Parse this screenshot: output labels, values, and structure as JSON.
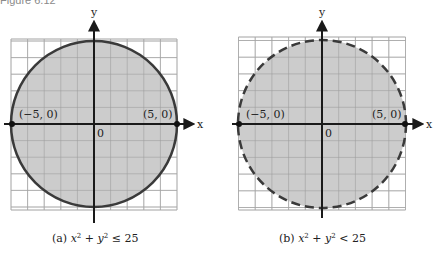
{
  "figure": {
    "title": "Figure 6.12"
  },
  "colors": {
    "fill": "#c8c8c8",
    "grid": "#b9b9b9",
    "stroke": "#3a3a3a",
    "axis": "#1a1a1a"
  },
  "panels": [
    {
      "id": "a",
      "caption_prefix": "(a) ",
      "caption_lhs_x": "x",
      "caption_lhs_exp": "2",
      "caption_plus": " + ",
      "caption_lhs_y": "y",
      "caption_lhs_exp2": "2",
      "caption_rel": " ≤ 25",
      "boundary": "solid",
      "points": [
        {
          "label": "(−5, 0)",
          "x": -5,
          "y": 0
        },
        {
          "label": "(5, 0)",
          "x": 5,
          "y": 0
        }
      ],
      "origin_label": "0",
      "x_axis_label": "x",
      "y_axis_label": "y"
    },
    {
      "id": "b",
      "caption_prefix": "(b) ",
      "caption_lhs_x": "x",
      "caption_lhs_exp": "2",
      "caption_plus": " + ",
      "caption_lhs_y": "y",
      "caption_lhs_exp2": "2",
      "caption_rel": " < 25",
      "boundary": "dashed",
      "points": [
        {
          "label": "(−5, 0)",
          "x": -5,
          "y": 0
        },
        {
          "label": "(5, 0)",
          "x": 5,
          "y": 0
        }
      ],
      "origin_label": "0",
      "x_axis_label": "x",
      "y_axis_label": "y"
    }
  ],
  "chart_data": [
    {
      "type": "region",
      "title": "(a) x^2 + y^2 ≤ 25",
      "inequality": "x^2 + y^2 <= 25",
      "center": [
        0,
        0
      ],
      "radius": 5,
      "boundary": "solid (included)",
      "labeled_points": [
        [
          -5,
          0
        ],
        [
          5,
          0
        ]
      ],
      "xlabel": "x",
      "ylabel": "y",
      "xlim": [
        -5,
        5
      ],
      "ylim": [
        -5,
        5
      ],
      "grid": true
    },
    {
      "type": "region",
      "title": "(b) x^2 + y^2 < 25",
      "inequality": "x^2 + y^2 < 25",
      "center": [
        0,
        0
      ],
      "radius": 5,
      "boundary": "dashed (excluded)",
      "labeled_points": [
        [
          -5,
          0
        ],
        [
          5,
          0
        ]
      ],
      "xlabel": "x",
      "ylabel": "y",
      "xlim": [
        -5,
        5
      ],
      "ylim": [
        -5,
        5
      ],
      "grid": true
    }
  ]
}
